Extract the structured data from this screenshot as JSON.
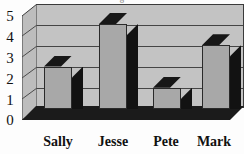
{
  "chart_data": {
    "type": "bar",
    "title": "",
    "title_partial_cutoff": "g",
    "xlabel": "",
    "ylabel": "",
    "categories": [
      "Sally",
      "Jesse",
      "Pete",
      "Mark"
    ],
    "values": [
      2,
      4,
      1,
      3
    ],
    "ylim": [
      0,
      5
    ],
    "yticks": [
      "0",
      "1",
      "2",
      "3",
      "4",
      "5"
    ],
    "grid": true,
    "legend": false,
    "style": "3d-column",
    "colors": {
      "bar_face": "#a8a8a8",
      "bar_side": "#121212",
      "bar_top": "#171717",
      "plot_background": "#c3c3c3",
      "side_wall": "#bdbdbd",
      "floor": "#1b1b1b",
      "axis_line": "#3b3b3b",
      "gridline": "#454545",
      "text": "#111111",
      "page_background": "#fdfdfd"
    }
  }
}
